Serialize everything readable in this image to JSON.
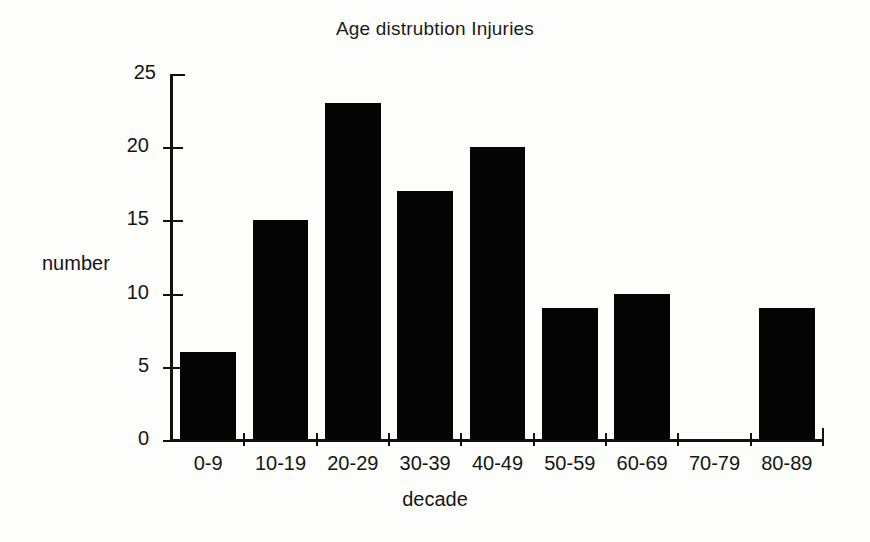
{
  "chart_data": {
    "type": "bar",
    "title": "Age distrubtion Injuries",
    "xlabel": "decade",
    "ylabel": "number",
    "categories": [
      "0-9",
      "10-19",
      "20-29",
      "30-39",
      "40-49",
      "50-59",
      "60-69",
      "70-79",
      "80-89"
    ],
    "values": [
      6,
      15,
      23,
      17,
      20,
      9,
      10,
      0,
      9
    ],
    "series": [
      {
        "name": "Injuries",
        "values": [
          6,
          15,
          23,
          17,
          20,
          9,
          10,
          0,
          9
        ]
      }
    ],
    "ylim": [
      0,
      25
    ],
    "ytick_labels": [
      "0",
      "5",
      "10",
      "15",
      "20",
      "25"
    ],
    "ytick_values": [
      0,
      5,
      10,
      15,
      20,
      25
    ],
    "grid": "off",
    "legend": "none",
    "bar_color": "#050505",
    "background_color": "#fdfdfb",
    "axis_color": "#111111"
  }
}
